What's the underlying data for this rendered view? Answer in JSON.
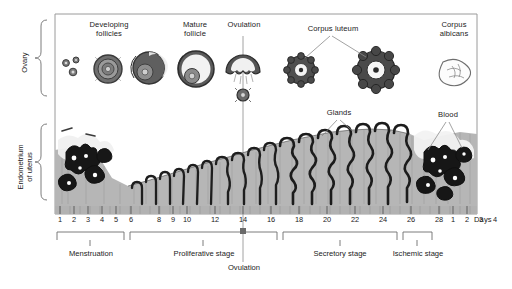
{
  "diagram": {
    "axis_label": "Days",
    "row_labels": {
      "ovary": "Ovary",
      "endometrium": "Endometrium\nof uterus"
    },
    "ovary_labels": [
      {
        "id": "developing-follicles",
        "text": "Developing\nfollicles"
      },
      {
        "id": "mature-follicle",
        "text": "Mature\nfollicle"
      },
      {
        "id": "ovulation",
        "text": "Ovulation"
      },
      {
        "id": "corpus-luteum",
        "text": "Corpus luteum"
      },
      {
        "id": "corpus-albicans",
        "text": "Corpus\nalbicans"
      }
    ],
    "endometrium_labels": [
      {
        "id": "glands",
        "text": "Glands"
      },
      {
        "id": "blood",
        "text": "Blood"
      }
    ],
    "ovulation_marker": "Ovulation",
    "day_ticks": [
      "1",
      "2",
      "3",
      "4",
      "5",
      "6",
      "8",
      "9",
      "10",
      "12",
      "14",
      "16",
      "18",
      "20",
      "22",
      "24",
      "26",
      "28",
      "1",
      "2",
      "3",
      "4"
    ],
    "stages": [
      {
        "id": "menstruation",
        "label": "Menstruation",
        "days": "1-5"
      },
      {
        "id": "proliferative-stage",
        "label": "Proliferative stage",
        "days": "6-14"
      },
      {
        "id": "secretory-stage",
        "label": "Secretory stage",
        "days": "15-26"
      },
      {
        "id": "ischemic-stage",
        "label": "Ischemic stage",
        "days": "27-28"
      }
    ],
    "colors": {
      "background": "#ffffff",
      "frame": "#9a9a9a",
      "endometrium_fill": "#b4b4b4",
      "gland_outline": "#1c1c1c",
      "follicle_dark": "#4a4a4a",
      "follicle_mid": "#8c8c8c",
      "text": "#222222",
      "leader_line": "#8a8a8a"
    }
  }
}
